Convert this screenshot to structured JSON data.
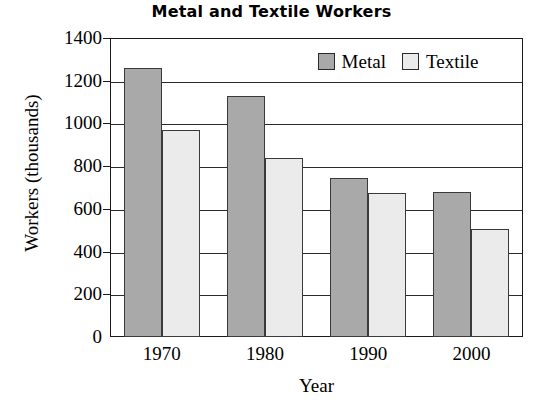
{
  "chart_data": {
    "type": "bar",
    "title": "Metal and Textile Workers",
    "xlabel": "Year",
    "ylabel": "Workers (thousands)",
    "categories": [
      "1970",
      "1980",
      "1990",
      "2000"
    ],
    "series": [
      {
        "name": "Metal",
        "color": "#a9a9a9",
        "values": [
          1260,
          1130,
          745,
          680
        ]
      },
      {
        "name": "Textile",
        "color": "#ebebeb",
        "values": [
          970,
          840,
          675,
          505
        ]
      }
    ],
    "ylim": [
      0,
      1400
    ],
    "ytick_step": 200,
    "yticks": [
      "1400",
      "1200",
      "1000",
      "800",
      "600",
      "400",
      "200",
      "0"
    ],
    "grid": true,
    "legend_position": "top-right"
  }
}
